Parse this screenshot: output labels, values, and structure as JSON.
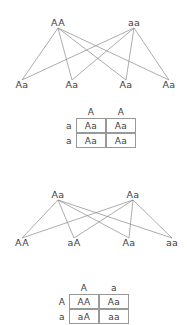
{
  "page": {
    "background_color": "#ffffff",
    "line_color": "#8a8a8a",
    "text_color": "#3d3d3d",
    "border_color": "#999999"
  },
  "crosses": [
    {
      "id": "cross-1",
      "parents": [
        {
          "label": "AA",
          "x": 58
        },
        {
          "label": "aa",
          "x": 134
        }
      ],
      "offspring": [
        {
          "label": "Aa",
          "x": 22
        },
        {
          "label": "Aa",
          "x": 72
        },
        {
          "label": "Aa",
          "x": 126
        },
        {
          "label": "Aa",
          "x": 169
        }
      ]
    },
    {
      "id": "cross-2",
      "parents": [
        {
          "label": "Aa",
          "x": 58
        },
        {
          "label": "Aa",
          "x": 133
        }
      ],
      "offspring": [
        {
          "label": "AA",
          "x": 22
        },
        {
          "label": "aA",
          "x": 74
        },
        {
          "label": "Aa",
          "x": 129
        },
        {
          "label": "aa",
          "x": 172
        }
      ]
    }
  ],
  "punnett_squares": [
    {
      "id": "punnett-1",
      "corner": "",
      "column_headers": [
        "A",
        "A"
      ],
      "row_headers": [
        "a",
        "a"
      ],
      "cells": [
        [
          "Aa",
          "Aa"
        ],
        [
          "Aa",
          "Aa"
        ]
      ]
    },
    {
      "id": "punnett-2",
      "corner": "",
      "column_headers": [
        "A",
        "a"
      ],
      "row_headers": [
        "A",
        "a"
      ],
      "cells": [
        [
          "AA",
          "Aa"
        ],
        [
          "aA",
          "aa"
        ]
      ]
    }
  ]
}
